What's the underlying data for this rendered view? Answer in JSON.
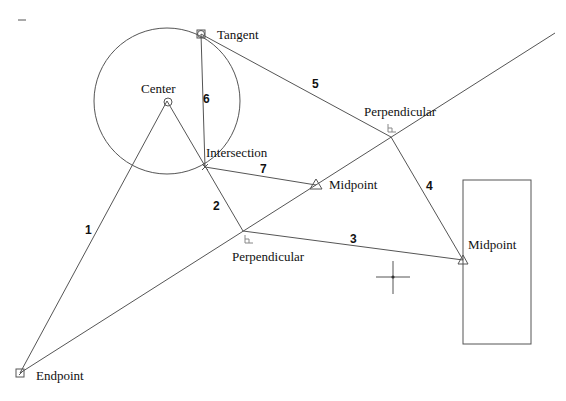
{
  "diagram": {
    "circle": {
      "cx": 167,
      "cy": 101,
      "r": 73
    },
    "rectangle": {
      "x": 463,
      "y": 180,
      "width": 68,
      "height": 164
    },
    "crosshair": {
      "x": 393,
      "y": 277,
      "arm": 17
    },
    "top_left_dash": {
      "x1": 18,
      "y1": 20,
      "x2": 26,
      "y2": 20
    },
    "points": {
      "center": {
        "x": 167,
        "y": 101
      },
      "tangent": {
        "x": 201,
        "y": 34
      },
      "intersection": {
        "x": 205,
        "y": 167
      },
      "perpendicular_lower": {
        "x": 243,
        "y": 231
      },
      "perpendicular_upper": {
        "x": 391,
        "y": 137
      },
      "midpoint_line": {
        "x": 316,
        "y": 185
      },
      "midpoint_rect": {
        "x": 463,
        "y": 260
      },
      "endpoint": {
        "x": 20,
        "y": 373
      },
      "long_line_end": {
        "x": 555,
        "y": 33
      }
    },
    "snap_labels": {
      "center": "Center",
      "tangent": "Tangent",
      "intersection": "Intersection",
      "perpendicular_lower": "Perpendicular",
      "perpendicular_upper": "Perpendicular",
      "midpoint_line": "Midpoint",
      "midpoint_rect": "Midpoint",
      "endpoint": "Endpoint"
    },
    "segments": [
      {
        "label": "1",
        "from": "endpoint",
        "to": "center"
      },
      {
        "label": "2",
        "from": "center",
        "to": "perpendicular_lower"
      },
      {
        "label": "3",
        "from": "perpendicular_lower",
        "to": "midpoint_rect"
      },
      {
        "label": "4",
        "from": "midpoint_rect",
        "to": "perpendicular_upper"
      },
      {
        "label": "5",
        "from": "perpendicular_upper",
        "to": "tangent"
      },
      {
        "label": "6",
        "from": "tangent",
        "to": "intersection"
      },
      {
        "label": "7",
        "from": "intersection",
        "to": "midpoint_line"
      }
    ],
    "segment_labels": [
      "1",
      "2",
      "3",
      "4",
      "5",
      "6",
      "7"
    ],
    "colors": {
      "line": "#555555",
      "text": "#111111",
      "background": "#ffffff"
    }
  }
}
